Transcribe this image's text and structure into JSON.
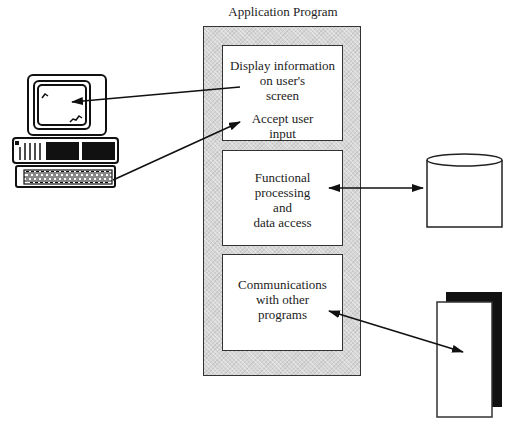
{
  "diagram": {
    "title": "Application Program",
    "modules": [
      {
        "name": "presentation",
        "lines": [
          "Display information",
          "on user's",
          "screen"
        ],
        "secondary_lines": [
          "Accept user",
          "input"
        ]
      },
      {
        "name": "processing",
        "lines": [
          "Functional",
          "processing",
          "and",
          "data access"
        ]
      },
      {
        "name": "communications",
        "lines": [
          "Communications",
          "with other",
          "programs"
        ]
      }
    ],
    "external": {
      "computer": "personal-computer-icon",
      "database": {
        "label": "Database"
      },
      "other_system": {
        "lines": [
          "Other",
          "System"
        ]
      }
    },
    "connections": [
      {
        "from": "presentation",
        "to": "computer-screen",
        "direction": "one-way"
      },
      {
        "from": "computer-keyboard",
        "to": "presentation",
        "direction": "one-way"
      },
      {
        "from": "processing",
        "to": "database",
        "direction": "two-way"
      },
      {
        "from": "communications",
        "to": "other_system",
        "direction": "two-way"
      }
    ],
    "colors": {
      "stroke": "#222222",
      "shade": "#d6d6d6",
      "background": "#ffffff"
    }
  }
}
